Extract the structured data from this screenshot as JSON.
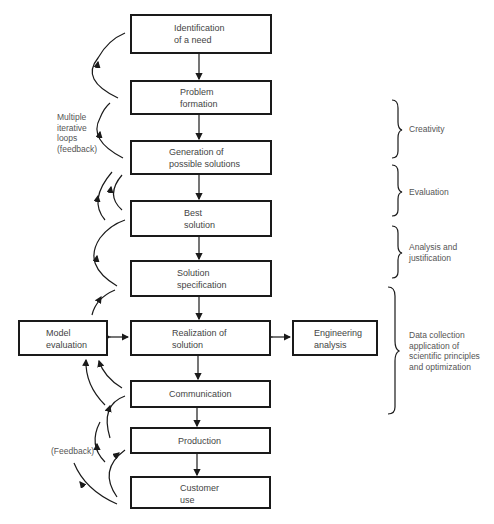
{
  "diagram": {
    "type": "flowchart",
    "main_flow": [
      {
        "id": "identification",
        "lines": [
          "Identification",
          "of a need"
        ]
      },
      {
        "id": "problem",
        "lines": [
          "Problem",
          "formation"
        ]
      },
      {
        "id": "generation",
        "lines": [
          "Generation of",
          "possible solutions"
        ]
      },
      {
        "id": "best",
        "lines": [
          "Best",
          "solution"
        ]
      },
      {
        "id": "specification",
        "lines": [
          "Solution",
          "specification"
        ]
      },
      {
        "id": "realization",
        "lines": [
          "Realization of",
          "solution"
        ]
      },
      {
        "id": "communication",
        "lines": [
          "Communication"
        ]
      },
      {
        "id": "production",
        "lines": [
          "Production"
        ]
      },
      {
        "id": "customer",
        "lines": [
          "Customer",
          "use"
        ]
      }
    ],
    "side_boxes": {
      "model": {
        "lines": [
          "Model",
          "evaluation"
        ]
      },
      "engineering": {
        "lines": [
          "Engineering",
          "analysis"
        ]
      }
    },
    "left_annotations": {
      "iterative": [
        "Multiple",
        "iterative",
        "loops",
        "(feedback)"
      ],
      "feedback": "(Feedback)"
    },
    "stages": [
      {
        "id": "creativity",
        "lines": [
          "Creativity"
        ]
      },
      {
        "id": "evaluation",
        "lines": [
          "Evaluation"
        ]
      },
      {
        "id": "analysis",
        "lines": [
          "Analysis and",
          "justification"
        ]
      },
      {
        "id": "data",
        "lines": [
          "Data collection",
          "application of",
          "scientific principles",
          "and optimization"
        ]
      }
    ],
    "edges": [
      [
        "identification",
        "problem"
      ],
      [
        "problem",
        "generation"
      ],
      [
        "generation",
        "best"
      ],
      [
        "best",
        "specification"
      ],
      [
        "specification",
        "realization"
      ],
      [
        "realization",
        "communication"
      ],
      [
        "communication",
        "production"
      ],
      [
        "production",
        "customer"
      ],
      [
        "realization",
        "model",
        "bidirectional"
      ],
      [
        "realization",
        "engineering",
        "bidirectional"
      ]
    ]
  }
}
